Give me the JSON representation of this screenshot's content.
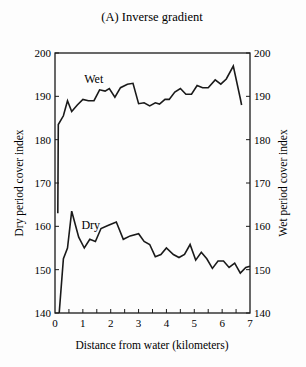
{
  "chart_data": {
    "type": "line",
    "title": "(A) Inverse gradient",
    "xlabel": "Distance from water (kilometers)",
    "ylabel_left": "Dry period cover index",
    "ylabel_right": "Wet period cover index",
    "xlim": [
      0,
      7
    ],
    "ylim_left": [
      140,
      200
    ],
    "ylim_right": [
      140,
      200
    ],
    "x_ticks": [
      0,
      1,
      2,
      3,
      4,
      5,
      6,
      7
    ],
    "x_minor_tick_step": 0.5,
    "y_ticks": [
      140,
      150,
      160,
      170,
      180,
      190,
      200
    ],
    "grid": false,
    "legend": "inline labels",
    "series": [
      {
        "name": "Wet",
        "axis": "right",
        "label_pos": {
          "x": 1.05,
          "y": 193
        },
        "points": [
          [
            0.1,
            163
          ],
          [
            0.12,
            183.5
          ],
          [
            0.3,
            185.5
          ],
          [
            0.45,
            189
          ],
          [
            0.6,
            186.5
          ],
          [
            0.8,
            188
          ],
          [
            1.0,
            189.3
          ],
          [
            1.2,
            189
          ],
          [
            1.4,
            189
          ],
          [
            1.6,
            191.5
          ],
          [
            1.8,
            191.2
          ],
          [
            1.95,
            191.8
          ],
          [
            2.15,
            189.8
          ],
          [
            2.35,
            192
          ],
          [
            2.6,
            192.8
          ],
          [
            2.8,
            193
          ],
          [
            3.0,
            188.3
          ],
          [
            3.2,
            188.5
          ],
          [
            3.4,
            187.8
          ],
          [
            3.6,
            188.5
          ],
          [
            3.75,
            188.2
          ],
          [
            3.95,
            189.3
          ],
          [
            4.1,
            189.3
          ],
          [
            4.3,
            191
          ],
          [
            4.5,
            191.8
          ],
          [
            4.7,
            190.5
          ],
          [
            4.9,
            190.5
          ],
          [
            5.1,
            192.5
          ],
          [
            5.3,
            192
          ],
          [
            5.5,
            192
          ],
          [
            5.75,
            193.8
          ],
          [
            5.95,
            192.8
          ],
          [
            6.15,
            194
          ],
          [
            6.4,
            197
          ],
          [
            6.65,
            189.5
          ],
          [
            6.7,
            188
          ]
        ]
      },
      {
        "name": "Dry",
        "axis": "left",
        "label_pos": {
          "x": 0.95,
          "y": 159.5
        },
        "points": [
          [
            0.15,
            140
          ],
          [
            0.3,
            152.5
          ],
          [
            0.45,
            155
          ],
          [
            0.6,
            163.5
          ],
          [
            0.85,
            157.5
          ],
          [
            1.05,
            155
          ],
          [
            1.25,
            157
          ],
          [
            1.45,
            156.5
          ],
          [
            1.65,
            159.5
          ],
          [
            1.9,
            160.2
          ],
          [
            2.2,
            161
          ],
          [
            2.45,
            157
          ],
          [
            2.7,
            157.8
          ],
          [
            3.0,
            158.3
          ],
          [
            3.2,
            156.5
          ],
          [
            3.4,
            155.8
          ],
          [
            3.6,
            153
          ],
          [
            3.8,
            153.5
          ],
          [
            4.0,
            155
          ],
          [
            4.25,
            153.5
          ],
          [
            4.45,
            152.8
          ],
          [
            4.65,
            153.5
          ],
          [
            4.85,
            155.8
          ],
          [
            5.05,
            152.2
          ],
          [
            5.25,
            154
          ],
          [
            5.45,
            152.5
          ],
          [
            5.65,
            150.3
          ],
          [
            5.85,
            152
          ],
          [
            6.05,
            152
          ],
          [
            6.25,
            150.5
          ],
          [
            6.45,
            151.5
          ],
          [
            6.65,
            149.2
          ],
          [
            6.85,
            150.5
          ],
          [
            7.0,
            150.8
          ]
        ]
      }
    ]
  },
  "style": {
    "line_color": "#1a1a1a",
    "background": "#fdfdfd"
  }
}
